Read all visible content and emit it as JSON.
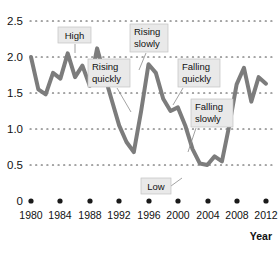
{
  "chart_data": {
    "type": "line",
    "title": "",
    "xlabel": "Year",
    "ylabel": "",
    "xlim": [
      1980,
      2012
    ],
    "ylim": [
      0,
      2.5
    ],
    "grid": true,
    "grid_style": "dotted-horizontal",
    "legend": "none",
    "line_color": "#7c7c7c",
    "line_width": 4,
    "x_ticks": [
      "1980",
      "1984",
      "1988",
      "1992",
      "1996",
      "2000",
      "2004",
      "2008",
      "2012"
    ],
    "y_ticks": [
      "0",
      "0.5",
      "1.0",
      "1.5",
      "2.0",
      "2.5"
    ],
    "series": [
      {
        "name": "value",
        "x": [
          1980,
          1981,
          1982,
          1983,
          1984,
          1985,
          1986,
          1987,
          1988,
          1989,
          1990,
          1991,
          1992,
          1993,
          1994,
          1995,
          1996,
          1997,
          1998,
          1999,
          2000,
          2001,
          2002,
          2003,
          2004,
          2005,
          2006,
          2007,
          2008,
          2009,
          2010,
          2011,
          2012
        ],
        "values": [
          2.0,
          1.55,
          1.48,
          1.78,
          1.7,
          2.05,
          1.72,
          1.88,
          1.6,
          2.12,
          1.75,
          1.4,
          1.05,
          0.82,
          0.68,
          1.25,
          1.9,
          1.78,
          1.42,
          1.25,
          1.3,
          1.05,
          0.72,
          0.52,
          0.5,
          0.62,
          0.55,
          1.05,
          1.62,
          1.85,
          1.38,
          1.72,
          1.63
        ]
      }
    ],
    "annotations": [
      {
        "label": "High",
        "text": "High",
        "point_x": 1989,
        "point_y": 2.12
      },
      {
        "label": "Rising slowly",
        "text": "Rising\nslowly",
        "point_x": 1995,
        "point_y": 1.25
      },
      {
        "label": "Rising quickly",
        "text": "Rising\nquickly",
        "point_x": 1994,
        "point_y": 0.72
      },
      {
        "label": "Falling quickly",
        "text": "Falling\nquickly",
        "point_x": 1992,
        "point_y": 1.05
      },
      {
        "label": "Falling slowly",
        "text": "Falling\nslowly",
        "point_x": 2001,
        "point_y": 1.0
      },
      {
        "label": "Low",
        "text": "Low",
        "point_x": 2004,
        "point_y": 0.5
      }
    ]
  },
  "axes": {
    "y_labels": [
      "2.5",
      "2.0",
      "1.5",
      "1.0",
      "0.5",
      "0"
    ],
    "x_labels": [
      "1980",
      "1984",
      "1988",
      "1992",
      "1996",
      "2000",
      "2004",
      "2008",
      "2012"
    ],
    "x_axis_title": "Year"
  },
  "callouts": {
    "high": {
      "line1": "High",
      "line2": ""
    },
    "rising_slowly": {
      "line1": "Rising",
      "line2": "slowly"
    },
    "rising_quickly": {
      "line1": "Rising",
      "line2": "quickly"
    },
    "falling_quickly": {
      "line1": "Falling",
      "line2": "quickly"
    },
    "falling_slowly": {
      "line1": "Falling",
      "line2": "slowly"
    },
    "low": {
      "line1": "Low",
      "line2": ""
    }
  },
  "colors": {
    "line": "#7c7c7c",
    "grid": "#4d4d4d",
    "callout_bg": "#e9e9e9",
    "callout_border": "#c2c2c2",
    "text": "#111111"
  }
}
